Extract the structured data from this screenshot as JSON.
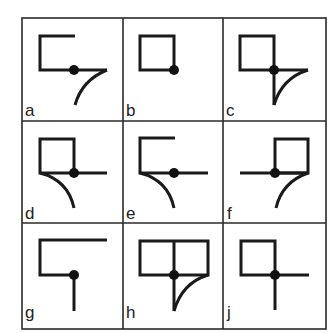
{
  "puzzle": {
    "grid": {
      "cols": [
        22,
        123,
        223,
        326
      ],
      "rows": [
        18,
        121,
        223,
        329
      ]
    },
    "cells": [
      {
        "label": "a",
        "row": 0,
        "col": 0,
        "description": "open square top-right, horizontal extends right, dot mid, curve from right end downward-left"
      },
      {
        "label": "b",
        "row": 0,
        "col": 1,
        "description": "closed square with dot at bottom-right corner"
      },
      {
        "label": "c",
        "row": 0,
        "col": 2,
        "description": "closed square, dot at bottom-right, horizontal right, vertical down, curve connecting ends"
      },
      {
        "label": "d",
        "row": 1,
        "col": 0,
        "description": "closed square, dot at bottom-right, horizontal right, curve from bottom-left corner downward"
      },
      {
        "label": "e",
        "row": 1,
        "col": 1,
        "description": "open square top-right, horizontal extends right with dot, curve from bottom-left downward"
      },
      {
        "label": "f",
        "row": 1,
        "col": 2,
        "description": "horizontal from left to dot, square to the right above, curve from right end downward"
      },
      {
        "label": "g",
        "row": 2,
        "col": 0,
        "description": "long top line, open bracket, dot at bottom-mid, vertical line down"
      },
      {
        "label": "h",
        "row": 2,
        "col": 1,
        "description": "double square (two boxes), dot at bottom-mid, vertical down, curve from bottom-right to vertical end"
      },
      {
        "label": "j",
        "row": 2,
        "col": 2,
        "description": "closed square, dot at bottom-right, horizontal right, vertical down"
      }
    ]
  }
}
